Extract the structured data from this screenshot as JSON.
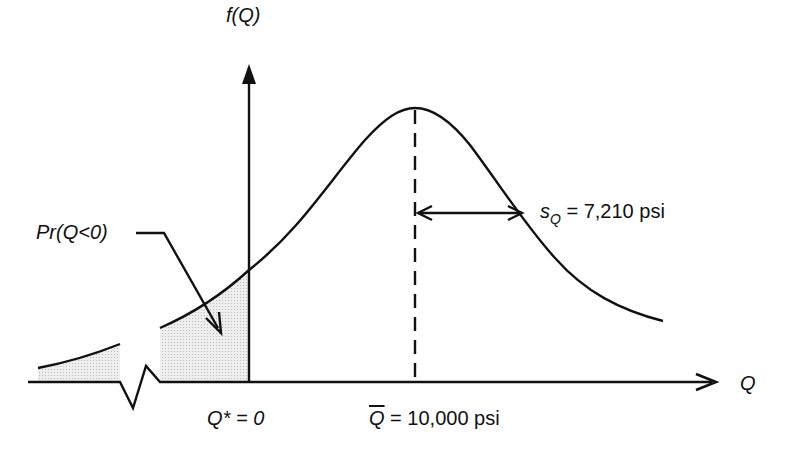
{
  "diagram": {
    "type": "normal probability density curve",
    "y_axis_label": "f(Q)",
    "x_axis_label": "Q",
    "callout_label": "Pr(Q<0)",
    "std_dev": {
      "symbol": "s",
      "subscript": "Q",
      "text": " = 7,210 psi"
    },
    "origin_label": {
      "symbol": "Q*",
      "text": " = 0"
    },
    "mean_label": {
      "symbol": "Q",
      "text": " = 10,000 psi"
    },
    "colors": {
      "line": "#111111",
      "shade": "#e6e6e6"
    }
  }
}
